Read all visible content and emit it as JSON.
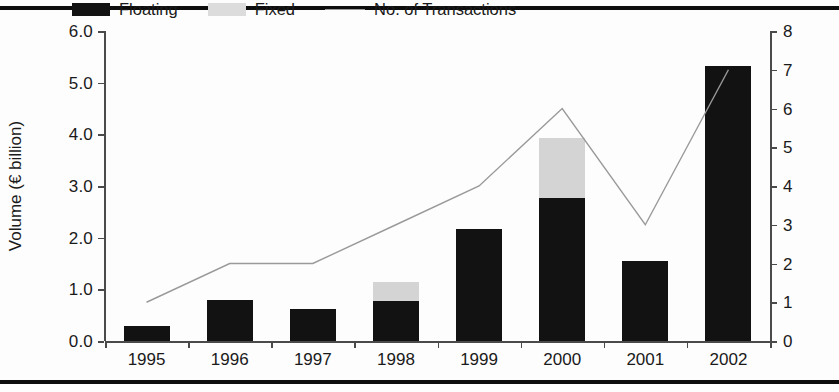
{
  "chart_data": {
    "type": "bar",
    "title": "",
    "categories": [
      "1995",
      "1996",
      "1997",
      "1998",
      "1999",
      "2000",
      "2001",
      "2002"
    ],
    "xlabel": "",
    "ylabel": "Volume (€ billion)",
    "ylim": [
      0,
      6
    ],
    "yticks": [
      "0.0",
      "1.0",
      "2.0",
      "3.0",
      "4.0",
      "5.0",
      "6.0"
    ],
    "y2label": "No. of Transactions",
    "y2lim": [
      0,
      8
    ],
    "y2ticks": [
      "0",
      "1",
      "2",
      "3",
      "4",
      "5",
      "6",
      "7",
      "8"
    ],
    "grid": false,
    "legend_position": "top-left-inside",
    "series": [
      {
        "name": "Floating",
        "type": "bar",
        "stack": "volume",
        "axis": "left",
        "color": "#121212",
        "values": [
          0.3,
          0.8,
          0.62,
          0.77,
          2.17,
          2.76,
          1.54,
          5.32
        ]
      },
      {
        "name": "Fixed",
        "type": "bar",
        "stack": "volume",
        "axis": "left",
        "color": "#d4d4d4",
        "values": [
          0.0,
          0.0,
          0.0,
          0.38,
          0.0,
          1.16,
          0.0,
          0.0
        ]
      },
      {
        "name": "No. of Transactions",
        "type": "line",
        "axis": "right",
        "color": "#9a9a9a",
        "values": [
          1,
          2,
          2,
          3,
          4,
          6,
          3,
          7
        ]
      }
    ],
    "totals": [
      0.3,
      0.8,
      0.62,
      1.15,
      2.17,
      3.92,
      1.54,
      5.32
    ]
  },
  "legend": {
    "items": [
      {
        "label": "Floating",
        "marker": "swatch-black"
      },
      {
        "label": "Fixed",
        "marker": "swatch-gray"
      },
      {
        "label": "No. of Transactions",
        "marker": "line-gray"
      }
    ]
  },
  "colors": {
    "floating": "#121212",
    "fixed": "#d4d4d4",
    "line": "#9a9a9a",
    "axis": "#4a4a4a",
    "rule": "#0d0d0d",
    "background": "#fdfdfd"
  }
}
